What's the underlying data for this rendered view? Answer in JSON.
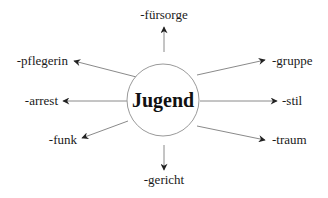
{
  "diagram": {
    "center": {
      "label": "Jugend",
      "cx": 163,
      "cy": 100,
      "r": 36
    },
    "colors": {
      "line": "#8a8a8a",
      "arrowhead": "#222222",
      "text": "#1a1a1a",
      "circle": "#9a9a9a"
    },
    "branches": [
      {
        "id": "fuersorge",
        "label": "-fürsorge",
        "x1": 164,
        "y1": 52,
        "x2": 164,
        "y2": 27,
        "tx": 164,
        "ty": 19,
        "anchor": "middle"
      },
      {
        "id": "gruppe",
        "label": "-gruppe",
        "x1": 197,
        "y1": 75,
        "x2": 265,
        "y2": 60,
        "tx": 272,
        "ty": 65,
        "anchor": "start"
      },
      {
        "id": "stil",
        "label": "-stil",
        "x1": 200,
        "y1": 101,
        "x2": 277,
        "y2": 101,
        "tx": 282,
        "ty": 105,
        "anchor": "start"
      },
      {
        "id": "traum",
        "label": "-traum",
        "x1": 197,
        "y1": 126,
        "x2": 265,
        "y2": 140,
        "tx": 272,
        "ty": 144,
        "anchor": "start"
      },
      {
        "id": "gericht",
        "label": "-gericht",
        "x1": 164,
        "y1": 145,
        "x2": 164,
        "y2": 170,
        "tx": 164,
        "ty": 184,
        "anchor": "middle"
      },
      {
        "id": "funk",
        "label": "-funk",
        "x1": 128,
        "y1": 121,
        "x2": 82,
        "y2": 138,
        "tx": 77,
        "ty": 144,
        "anchor": "end"
      },
      {
        "id": "arrest",
        "label": "-arrest",
        "x1": 127,
        "y1": 101,
        "x2": 63,
        "y2": 101,
        "tx": 58,
        "ty": 105,
        "anchor": "end"
      },
      {
        "id": "pflegerin",
        "label": "-pflegerin",
        "x1": 152,
        "y1": 81,
        "x2": 74,
        "y2": 61,
        "tx": 68,
        "ty": 65,
        "anchor": "end"
      }
    ]
  }
}
